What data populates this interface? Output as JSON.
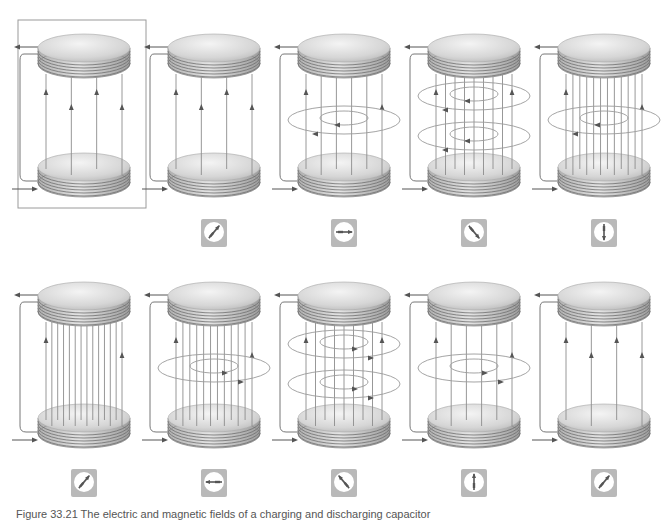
{
  "figure": {
    "caption": "Figure 33.21  The electric and magnetic fields of a charging and discharging capacitor",
    "colors": {
      "plate_top": "#eeeeee",
      "plate_mid": "#c9c9c9",
      "plate_edge": "#8a8a8a",
      "field_line": "#8c8c8c",
      "arrow": "#555555",
      "wire": "#777777",
      "loop": "#9a9a9a",
      "compass_bg": "#b9b9b9",
      "compass_face": "#ffffff",
      "needle": "#555555",
      "frame": "#9a9a9a"
    },
    "rows": [
      {
        "top_plate_y": 48,
        "bottom_plate_y": 167,
        "compass_y": 219,
        "panels": [
          {
            "id": "r1p1",
            "cx": 84,
            "field_lines": 4,
            "rings": 0,
            "ring_direction": "none",
            "framed": true,
            "compass": null
          },
          {
            "id": "r1p2",
            "cx": 214,
            "field_lines": 4,
            "rings": 0,
            "ring_direction": "none",
            "framed": false,
            "compass": {
              "angle": 40
            }
          },
          {
            "id": "r1p3",
            "cx": 344,
            "field_lines": 6,
            "rings": 1,
            "ring_direction": "ccw",
            "framed": false,
            "compass": {
              "angle": 90
            }
          },
          {
            "id": "r1p4",
            "cx": 474,
            "field_lines": 9,
            "rings": 2,
            "ring_direction": "ccw",
            "framed": false,
            "compass": {
              "angle": 140
            }
          },
          {
            "id": "r1p5",
            "cx": 604,
            "field_lines": 12,
            "rings": 1,
            "ring_direction": "ccw",
            "framed": false,
            "compass": {
              "angle": 180
            }
          }
        ]
      },
      {
        "top_plate_y": 296,
        "bottom_plate_y": 418,
        "compass_y": 469,
        "panels": [
          {
            "id": "r2p1",
            "cx": 84,
            "field_lines": 14,
            "rings": 0,
            "ring_direction": "none",
            "framed": false,
            "compass": {
              "angle": 40
            }
          },
          {
            "id": "r2p2",
            "cx": 214,
            "field_lines": 12,
            "rings": 1,
            "ring_direction": "cw",
            "framed": false,
            "compass": {
              "angle": 270
            }
          },
          {
            "id": "r2p3",
            "cx": 344,
            "field_lines": 9,
            "rings": 2,
            "ring_direction": "cw",
            "framed": false,
            "compass": {
              "angle": 320
            }
          },
          {
            "id": "r2p4",
            "cx": 474,
            "field_lines": 6,
            "rings": 1,
            "ring_direction": "cw",
            "framed": false,
            "compass": {
              "angle": 0
            }
          },
          {
            "id": "r2p5",
            "cx": 604,
            "field_lines": 4,
            "rings": 0,
            "ring_direction": "none",
            "framed": false,
            "compass": {
              "angle": 40
            }
          }
        ]
      }
    ],
    "icons": {
      "plate": "capacitor-plate-icon",
      "field": "electric-field-line-icon",
      "ring": "magnetic-field-loop-icon",
      "compass": "compass-icon",
      "current_in": "current-in-arrow-icon",
      "current_out": "current-out-arrow-icon"
    }
  }
}
